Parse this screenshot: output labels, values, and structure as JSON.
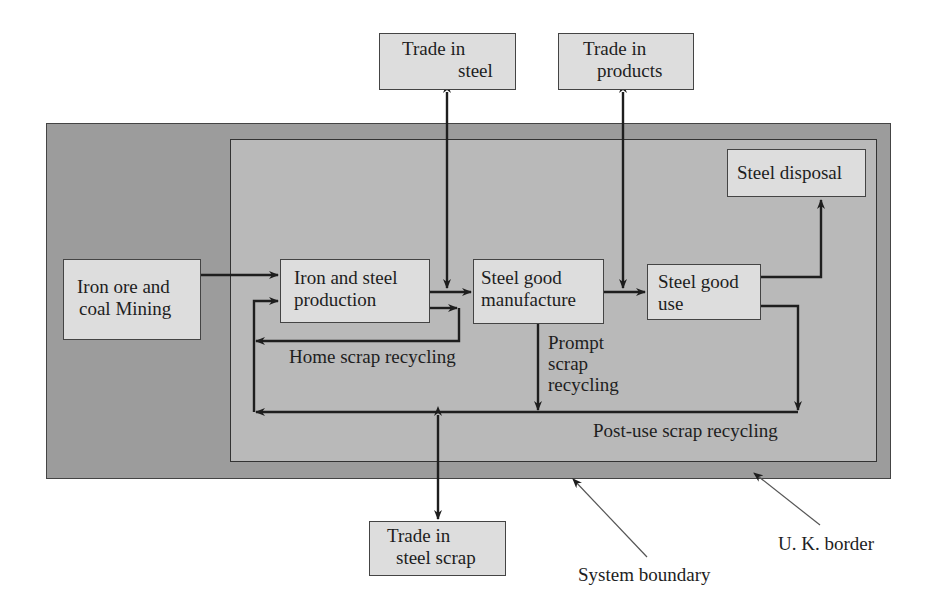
{
  "diagram": {
    "type": "flow-diagram",
    "colors": {
      "uk_border_fill": "#9c9c9c",
      "system_boundary_fill": "#b9b9b9",
      "box_fill": "#dddddd",
      "line": "#1e1e1e"
    },
    "regions": {
      "uk_border": {
        "label": "U. K. border"
      },
      "system_boundary": {
        "label": "System boundary"
      }
    },
    "nodes": {
      "trade_in_steel": {
        "line1": "Trade in",
        "line2": "steel"
      },
      "trade_in_products": {
        "line1": "Trade in",
        "line2": "products"
      },
      "steel_disposal": {
        "line1": "Steel disposal"
      },
      "iron_ore_mining": {
        "line1": "Iron ore and",
        "line2": "coal Mining"
      },
      "iron_steel_production": {
        "line1": "Iron and steel",
        "line2": "production"
      },
      "steel_good_manufacture": {
        "line1": "Steel good",
        "line2": "manufacture"
      },
      "steel_good_use": {
        "line1": "Steel good",
        "line2": "use"
      },
      "trade_in_steel_scrap": {
        "line1": "Trade in",
        "line2": "steel scrap"
      }
    },
    "flow_labels": {
      "home_scrap": "Home scrap recycling",
      "prompt_scrap_1": "Prompt",
      "prompt_scrap_2": "scrap",
      "prompt_scrap_3": "recycling",
      "post_use_scrap": "Post-use scrap recycling"
    },
    "edges": [
      {
        "from": "Iron ore and coal Mining",
        "to": "Iron and steel production"
      },
      {
        "from": "Iron and steel production",
        "to": "Steel good manufacture"
      },
      {
        "from": "Steel good manufacture",
        "to": "Steel good use"
      },
      {
        "from": "Steel good use",
        "to": "Steel disposal"
      },
      {
        "from": "Trade in steel",
        "to": "Steel good manufacture",
        "bidirectional": true
      },
      {
        "from": "Trade in products",
        "to": "Steel good use",
        "bidirectional": true
      },
      {
        "from": "Iron and steel production",
        "to": "Iron and steel production",
        "label": "Home scrap recycling"
      },
      {
        "from": "Steel good manufacture",
        "to": "Iron and steel production",
        "label": "Prompt scrap recycling"
      },
      {
        "from": "Steel good use",
        "to": "Iron and steel production",
        "label": "Post-use scrap recycling"
      },
      {
        "from": "Trade in steel scrap",
        "to": "Post-use scrap recycling loop",
        "bidirectional": true
      }
    ]
  }
}
